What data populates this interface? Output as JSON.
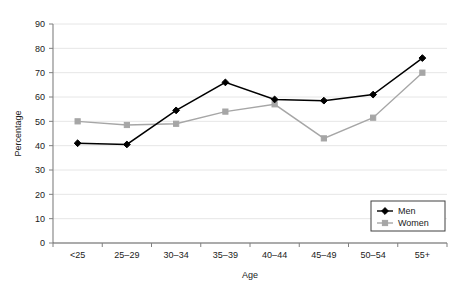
{
  "chart_data": {
    "type": "line",
    "title": "",
    "xlabel": "Age",
    "ylabel": "Percentage",
    "categories": [
      "<25",
      "25–29",
      "30–34",
      "35–39",
      "40–44",
      "45–49",
      "50–54",
      "55+"
    ],
    "series": [
      {
        "name": "Men",
        "color": "#000000",
        "marker": "diamond",
        "values": [
          41,
          40.5,
          54.5,
          66,
          59,
          58.5,
          61,
          76
        ]
      },
      {
        "name": "Women",
        "color": "#a6a6a6",
        "marker": "square",
        "values": [
          50,
          48.5,
          49,
          54,
          57,
          43,
          51.5,
          70
        ]
      }
    ],
    "ylim": [
      0,
      90
    ],
    "ytick_step": 10,
    "yticks": [
      "0",
      "10",
      "20",
      "30",
      "40",
      "50",
      "60",
      "70",
      "80",
      "90"
    ],
    "grid": "horizontal",
    "legend_position": "bottom-right",
    "gridline_color": "#e6e6e6",
    "axis_color": "#808080"
  },
  "legend": {
    "entries": [
      {
        "label": "Men"
      },
      {
        "label": "Women"
      }
    ]
  }
}
